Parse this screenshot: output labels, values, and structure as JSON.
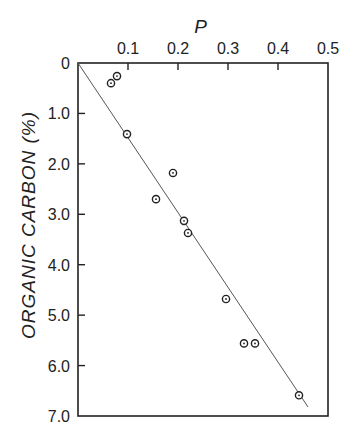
{
  "chart_data": {
    "type": "scatter",
    "title": "",
    "xlabel": "P",
    "ylabel": "ORGANIC CARBON (%)",
    "x_axis_position": "top",
    "y_axis_inverted": true,
    "xlim": [
      0,
      0.5
    ],
    "ylim": [
      0,
      7.0
    ],
    "x_ticks": [
      0.1,
      0.2,
      0.3,
      0.4,
      0.5
    ],
    "x_tick_labels": [
      "0.1",
      "0.2",
      "0.3",
      "0.4",
      "0.5"
    ],
    "y_ticks": [
      0,
      1.0,
      2.0,
      3.0,
      4.0,
      5.0,
      6.0,
      7.0
    ],
    "y_tick_labels": [
      "0",
      "1.0",
      "2.0",
      "3.0",
      "4.0",
      "5.0",
      "6.0",
      "7.0"
    ],
    "grid": false,
    "legend": null,
    "marker": "circle-dot",
    "series": [
      {
        "name": "observations",
        "points": [
          {
            "x": 0.078,
            "y": 0.26
          },
          {
            "x": 0.066,
            "y": 0.4
          },
          {
            "x": 0.098,
            "y": 1.41
          },
          {
            "x": 0.19,
            "y": 2.18
          },
          {
            "x": 0.156,
            "y": 2.7
          },
          {
            "x": 0.212,
            "y": 3.13
          },
          {
            "x": 0.22,
            "y": 3.37
          },
          {
            "x": 0.296,
            "y": 4.68
          },
          {
            "x": 0.332,
            "y": 5.56
          },
          {
            "x": 0.354,
            "y": 5.56
          },
          {
            "x": 0.442,
            "y": 6.59
          }
        ]
      }
    ],
    "fit_line": {
      "name": "linear fit",
      "from": {
        "x": 0,
        "y": 0
      },
      "to": {
        "x": 0.46,
        "y": 6.82
      }
    }
  },
  "header_fragment": "… (cropped running header) …"
}
